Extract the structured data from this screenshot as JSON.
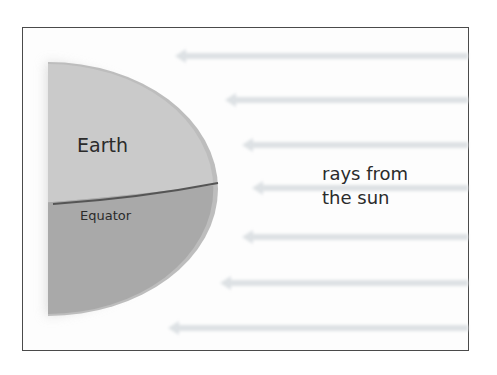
{
  "diagram": {
    "labels": {
      "earth": "Earth",
      "equator": "Equator",
      "rays_line1": "rays from",
      "rays_line2": "the sun"
    },
    "colors": {
      "frame_border": "#4a4a4a",
      "earth_upper": "#c9c9c9",
      "earth_lower": "#a8a8a8",
      "earth_rim": "#bcbcbc",
      "equator_line": "#555555",
      "ray": "#dfe3e6",
      "text": "#2b2b2b"
    },
    "rays": [
      {
        "y": 56,
        "x_start": 175,
        "x_end": 468
      },
      {
        "y": 100,
        "x_start": 225,
        "x_end": 468
      },
      {
        "y": 145,
        "x_start": 242,
        "x_end": 468
      },
      {
        "y": 188,
        "x_start": 252,
        "x_end": 468
      },
      {
        "y": 237,
        "x_start": 242,
        "x_end": 468
      },
      {
        "y": 283,
        "x_start": 220,
        "x_end": 468
      },
      {
        "y": 328,
        "x_start": 168,
        "x_end": 468
      }
    ]
  }
}
